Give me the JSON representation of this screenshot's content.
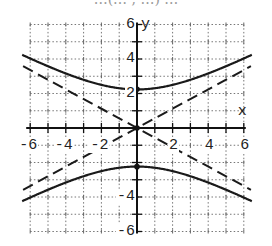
{
  "title_cut_off": "…(… , …) …",
  "chart_data": {
    "type": "line",
    "title": "",
    "xlabel": "x",
    "ylabel": "y",
    "xlim": [
      -6,
      6
    ],
    "ylim": [
      -6,
      6
    ],
    "grid": true,
    "grid_style": "dotted",
    "x_ticks": [
      -6,
      -4,
      -2,
      2,
      4,
      6
    ],
    "y_ticks": [
      6,
      4,
      2,
      -4,
      -6
    ],
    "x_tick_labels": [
      "-6",
      "-4",
      "-2",
      "2",
      "4",
      "6"
    ],
    "y_tick_labels": [
      "6",
      "4",
      "2",
      "-4",
      "-6"
    ],
    "series": [
      {
        "name": "hyperbola upper branch",
        "style": "solid",
        "equation": "y^2/5 - x^2/16 = 1 (y > 0)",
        "x": [
          -6.4,
          -6,
          -4,
          -2,
          0,
          2,
          4,
          6,
          6.4
        ],
        "y": [
          3.61,
          3.43,
          3.16,
          2.5,
          2.24,
          2.5,
          3.16,
          3.43,
          3.61
        ]
      },
      {
        "name": "hyperbola lower branch",
        "style": "solid",
        "equation": "y^2/5 - x^2/16 = 1 (y < 0)",
        "x": [
          -6.4,
          -6,
          -4,
          -2,
          0,
          2,
          4,
          6,
          6.4
        ],
        "y": [
          -3.61,
          -3.43,
          -3.16,
          -2.5,
          -2.24,
          -2.5,
          -3.16,
          -3.43,
          -3.61
        ]
      },
      {
        "name": "asymptote positive slope",
        "style": "dashed",
        "equation": "y = (sqrt5/4) x",
        "x": [
          -6.4,
          6.4
        ],
        "y": [
          -3.58,
          3.58
        ]
      },
      {
        "name": "asymptote negative slope",
        "style": "dashed",
        "equation": "y = -(sqrt5/4) x",
        "x": [
          -6.4,
          6.4
        ],
        "y": [
          3.58,
          -3.58
        ]
      }
    ],
    "points": [
      {
        "name": "upper vertex",
        "x": 0,
        "y": 2.24
      },
      {
        "name": "lower vertex",
        "x": 0,
        "y": -2.24
      },
      {
        "name": "center",
        "x": 0,
        "y": 0
      }
    ]
  }
}
